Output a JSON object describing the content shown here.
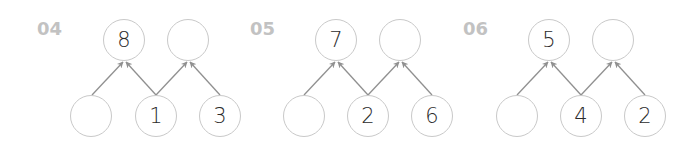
{
  "problems": [
    {
      "number": "04",
      "top": [
        "8",
        ""
      ],
      "bottom": [
        "",
        "1",
        "3"
      ]
    },
    {
      "number": "05",
      "top": [
        "7",
        ""
      ],
      "bottom": [
        "",
        "2",
        "6"
      ]
    },
    {
      "number": "06",
      "top": [
        "5",
        ""
      ],
      "bottom": [
        "",
        "4",
        "2"
      ]
    }
  ],
  "colors": {
    "number_label": "#c2c2c2",
    "circle_stroke": "#c9c9c9",
    "arrow": "#909090",
    "digit": "#2b2b2b"
  }
}
